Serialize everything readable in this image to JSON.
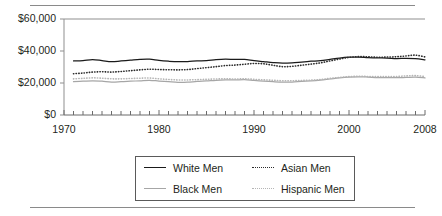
{
  "chart_data": {
    "type": "line",
    "title": "",
    "subtitle": "",
    "xlabel": "",
    "ylabel": "",
    "xlim": [
      1970,
      2008
    ],
    "ylim": [
      0,
      60000
    ],
    "grid": false,
    "legend_position": "bottom",
    "y_ticks": [
      0,
      20000,
      40000,
      60000
    ],
    "y_tick_labels": [
      "$0",
      "$20,000",
      "$40,000",
      "$60,000"
    ],
    "x_ticks": [
      1970,
      1980,
      1990,
      2000,
      2008
    ],
    "x_tick_labels": [
      "1970",
      "1980",
      "1990",
      "2000",
      "2008"
    ],
    "x_minor_tick_interval": 1,
    "x": [
      1971,
      1972,
      1973,
      1974,
      1975,
      1976,
      1977,
      1978,
      1979,
      1980,
      1981,
      1982,
      1983,
      1984,
      1985,
      1986,
      1987,
      1988,
      1989,
      1990,
      1991,
      1992,
      1993,
      1994,
      1995,
      1996,
      1997,
      1998,
      1999,
      2000,
      2001,
      2002,
      2003,
      2004,
      2005,
      2006,
      2007,
      2008
    ],
    "series": [
      {
        "name": "White Men",
        "style": "solid",
        "color": "#1a1a1a",
        "values": [
          33800,
          34000,
          34600,
          34000,
          33300,
          33800,
          34300,
          34800,
          34900,
          34100,
          33600,
          33300,
          33400,
          33800,
          34000,
          34600,
          34900,
          34700,
          34800,
          34000,
          33400,
          32800,
          32400,
          32600,
          33100,
          33600,
          34000,
          34800,
          35600,
          36100,
          36200,
          35900,
          35700,
          35600,
          35300,
          35400,
          35200,
          34500
        ]
      },
      {
        "name": "Black Men",
        "style": "solid",
        "color": "#a6a6a6",
        "values": [
          20800,
          21100,
          21400,
          21100,
          20600,
          20800,
          21100,
          21400,
          21700,
          21200,
          20800,
          20400,
          20500,
          21000,
          21300,
          21700,
          21900,
          21900,
          22100,
          21600,
          21200,
          20800,
          20500,
          20600,
          21000,
          21300,
          21800,
          22500,
          23200,
          23700,
          23900,
          23700,
          23400,
          23400,
          23300,
          23500,
          23700,
          23200
        ]
      },
      {
        "name": "Asian Men",
        "style": "dotted",
        "color": "#2b2b2b",
        "values": [
          25800,
          26200,
          26800,
          27000,
          26800,
          27200,
          27700,
          28200,
          28600,
          28400,
          28300,
          28200,
          28400,
          29000,
          29600,
          30200,
          30900,
          31200,
          31700,
          32200,
          32000,
          31100,
          30200,
          30400,
          31100,
          31800,
          32600,
          33800,
          35000,
          36000,
          36500,
          36400,
          36100,
          36200,
          36400,
          36900,
          37400,
          36300
        ]
      },
      {
        "name": "Hispanic Men",
        "style": "dotted",
        "color": "#b5b5b5",
        "values": [
          22600,
          22900,
          23200,
          23000,
          22600,
          22600,
          22800,
          23000,
          23100,
          22600,
          22200,
          21900,
          21900,
          22100,
          22300,
          22500,
          22600,
          22500,
          22600,
          22300,
          22000,
          21700,
          21400,
          21400,
          21600,
          21800,
          22200,
          22900,
          23500,
          24000,
          24200,
          24100,
          24000,
          24100,
          24100,
          24400,
          24600,
          24000
        ]
      }
    ]
  },
  "legend": {
    "items": [
      {
        "label": "White Men",
        "swatch": "solid-dark"
      },
      {
        "label": "Asian Men",
        "swatch": "dot-dark"
      },
      {
        "label": "Black Men",
        "swatch": "solid-light"
      },
      {
        "label": "Hispanic Men",
        "swatch": "dot-light"
      }
    ]
  }
}
